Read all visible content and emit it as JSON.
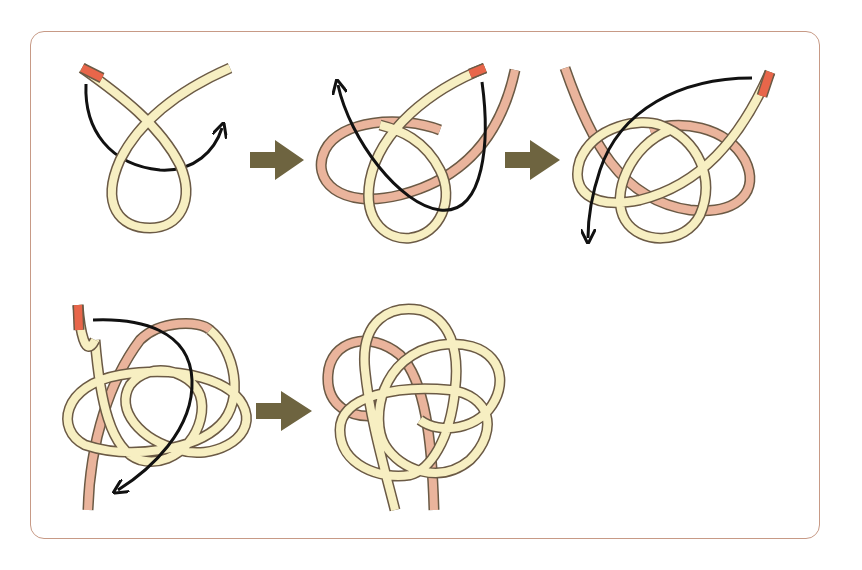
{
  "title": "Knot tying sequence",
  "colors": {
    "frame": "#c79a86",
    "cord_cream": "#f7efc2",
    "cord_pink": "#eab49c",
    "cord_tip": "#e8664a",
    "cord_outline": "#6b5a45",
    "path_arrow": "#111111",
    "step_arrow": "#6e6440"
  },
  "steps": [
    {
      "index": 1,
      "label": "Step 1: form a loop, working end passes behind"
    },
    {
      "index": 2,
      "label": "Step 2: second loop, working end weaves up"
    },
    {
      "index": 3,
      "label": "Step 3: third loop, working end weaves down"
    },
    {
      "index": 4,
      "label": "Step 4: weave through to complete pattern"
    },
    {
      "index": 5,
      "label": "Step 5: finished knot"
    }
  ],
  "transitions": [
    {
      "from": 1,
      "to": 2,
      "icon": "right-arrow-icon"
    },
    {
      "from": 2,
      "to": 3,
      "icon": "right-arrow-icon"
    },
    {
      "from": 4,
      "to": 5,
      "icon": "right-arrow-icon"
    }
  ]
}
